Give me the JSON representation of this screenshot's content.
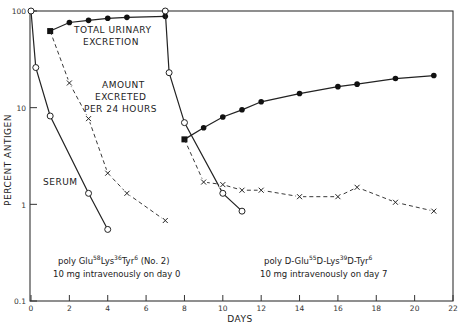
{
  "chart_data": {
    "type": "line",
    "title": "",
    "xlabel": "DAYS",
    "ylabel": "PERCENT ANTIGEN",
    "xlim": [
      0,
      22
    ],
    "ylim": [
      0.1,
      100
    ],
    "yscale": "log",
    "x_ticks": [
      0,
      2,
      4,
      6,
      8,
      10,
      12,
      14,
      16,
      18,
      20,
      22
    ],
    "y_ticks": [
      0.1,
      1,
      10,
      100
    ],
    "y_tick_labels": [
      "0.1",
      "1",
      "10",
      "100"
    ],
    "grid": false,
    "annotations": {
      "total_urinary": [
        "TOTAL URINARY",
        "EXCRETION"
      ],
      "amount_excreted": [
        "AMOUNT",
        "EXCRETED",
        "PER 24 HOURS"
      ],
      "serum": "SERUM",
      "antigen1_line1": {
        "parts": [
          "poly Glu",
          "58",
          "Lys",
          "36",
          "Tyr",
          "6",
          " (No. 2)"
        ]
      },
      "antigen1_line2": "10 mg intravenously on day 0",
      "antigen2_line1": {
        "parts": [
          "poly D-Glu",
          "55",
          "D-Lys",
          "39",
          "D-Tyr",
          "6"
        ]
      },
      "antigen2_line2": "10 mg intravenously on day 7"
    },
    "series": [
      {
        "name": "Serum (antigen 1)",
        "style": "solid-open-circle",
        "x": [
          0,
          0.25,
          1,
          3,
          4
        ],
        "y": [
          100,
          26,
          8.2,
          1.3,
          0.55
        ]
      },
      {
        "name": "Total urinary excretion (antigen 1)",
        "style": "solid-filled-circle",
        "x": [
          1,
          2,
          3,
          4,
          5,
          7
        ],
        "y": [
          62,
          76,
          80,
          84,
          86,
          88
        ]
      },
      {
        "name": "Amount excreted per 24 hours (antigen 1)",
        "style": "dashed-x",
        "x": [
          1,
          2,
          3,
          4,
          5,
          7
        ],
        "y": [
          62,
          18,
          7.7,
          2.1,
          1.3,
          0.68
        ]
      },
      {
        "name": "Serum (antigen 2)",
        "style": "solid-open-circle",
        "x": [
          7,
          7.2,
          8,
          10,
          11
        ],
        "y": [
          100,
          23,
          7,
          1.3,
          0.85
        ]
      },
      {
        "name": "Total urinary excretion (antigen 2)",
        "style": "solid-filled-circle",
        "x": [
          8,
          9,
          10,
          11,
          12,
          14,
          16,
          17,
          19,
          21
        ],
        "y": [
          4.7,
          6.2,
          8,
          9.5,
          11.5,
          14,
          16.5,
          17.5,
          20,
          21.5
        ]
      },
      {
        "name": "Amount excreted per 24 hours (antigen 2)",
        "style": "dashed-x",
        "x": [
          8,
          9,
          10,
          11,
          12,
          14,
          16,
          17,
          19,
          21
        ],
        "y": [
          4.7,
          1.7,
          1.6,
          1.4,
          1.4,
          1.2,
          1.2,
          1.5,
          1.05,
          0.85
        ]
      }
    ]
  }
}
